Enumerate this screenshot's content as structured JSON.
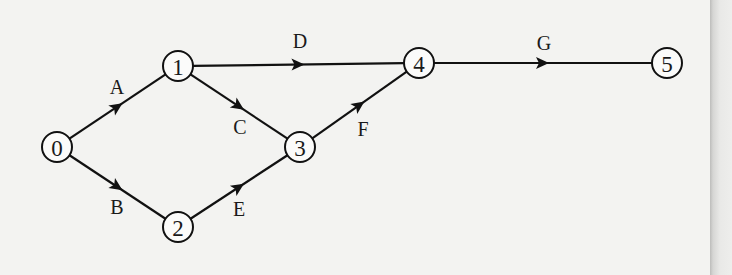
{
  "diagram": {
    "type": "activity-network",
    "node_radius": 15,
    "colors": {
      "stroke": "#111111",
      "node_fill": "#fbfbfa",
      "background": "#f3f3f1"
    },
    "nodes": [
      {
        "id": "0",
        "label": "0",
        "x": 57,
        "y": 147
      },
      {
        "id": "1",
        "label": "1",
        "x": 178,
        "y": 66
      },
      {
        "id": "2",
        "label": "2",
        "x": 178,
        "y": 227
      },
      {
        "id": "3",
        "label": "3",
        "x": 300,
        "y": 147
      },
      {
        "id": "4",
        "label": "4",
        "x": 419,
        "y": 63
      },
      {
        "id": "5",
        "label": "5",
        "x": 667,
        "y": 63
      }
    ],
    "edges": [
      {
        "id": "A",
        "label": "A",
        "from": "0",
        "to": "1",
        "label_x": 117,
        "label_y": 87
      },
      {
        "id": "B",
        "label": "B",
        "from": "0",
        "to": "2",
        "label_x": 117,
        "label_y": 207
      },
      {
        "id": "C",
        "label": "C",
        "from": "1",
        "to": "3",
        "label_x": 240,
        "label_y": 127
      },
      {
        "id": "D",
        "label": "D",
        "from": "1",
        "to": "4",
        "label_x": 300,
        "label_y": 41
      },
      {
        "id": "E",
        "label": "E",
        "from": "2",
        "to": "3",
        "label_x": 239,
        "label_y": 209
      },
      {
        "id": "F",
        "label": "F",
        "from": "3",
        "to": "4",
        "label_x": 363,
        "label_y": 129
      },
      {
        "id": "G",
        "label": "G",
        "from": "4",
        "to": "5",
        "label_x": 544,
        "label_y": 43
      }
    ]
  }
}
